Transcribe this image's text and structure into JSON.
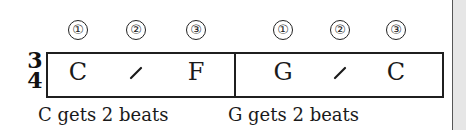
{
  "time_signature": {
    "top": "3",
    "bottom": "4"
  },
  "measures": [
    {
      "beats": [
        "①",
        "②",
        "③"
      ],
      "slots": [
        {
          "type": "chord",
          "label": "C"
        },
        {
          "type": "slash",
          "label": "/"
        },
        {
          "type": "chord",
          "label": "F"
        }
      ],
      "caption": "C gets 2 beats"
    },
    {
      "beats": [
        "①",
        "②",
        "③"
      ],
      "slots": [
        {
          "type": "chord",
          "label": "G"
        },
        {
          "type": "slash",
          "label": "/"
        },
        {
          "type": "chord",
          "label": "C"
        }
      ],
      "caption": "G gets 2 beats"
    }
  ],
  "colors": {
    "ink": "#1a1a1a",
    "page": "#ffffff",
    "margin_strip": "#e6e6e6"
  }
}
